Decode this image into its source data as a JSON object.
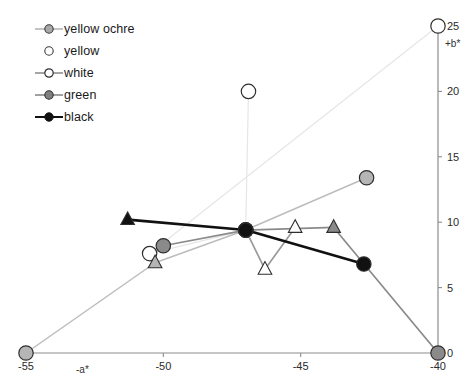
{
  "chart_data": {
    "type": "scatter",
    "title": "",
    "xlabel": "-a*",
    "ylabel": "+b*",
    "xlim": [
      -55,
      -40
    ],
    "ylim": [
      0,
      25
    ],
    "xticks": [
      -55,
      -50,
      -45,
      -40
    ],
    "xticklabels": [
      "-55",
      "-50",
      "-45",
      "-40"
    ],
    "yticks": [
      0,
      5,
      10,
      15,
      20,
      25
    ],
    "yticklabels": [
      "0",
      "5",
      "10",
      "15",
      "20",
      "25"
    ],
    "grid": false,
    "legend_position": "top-left",
    "axes_style": "bottom-x-axis, right-y-axis",
    "series": [
      {
        "name": "yellow ochre",
        "color": "#b5b5b5",
        "marker": "mixed-circle-triangle",
        "line": true,
        "points": [
          {
            "x": -55.0,
            "y": 0.0,
            "marker": "circle"
          },
          {
            "x": -50.3,
            "y": 6.9,
            "marker": "triangle"
          },
          {
            "x": -47.0,
            "y": 9.4,
            "marker": "circle"
          },
          {
            "x": -42.6,
            "y": 13.4,
            "marker": "circle"
          }
        ]
      },
      {
        "name": "yellow",
        "color": "#efefef",
        "marker": "open-circle",
        "line": true,
        "points": [
          {
            "x": -46.9,
            "y": 20.0,
            "marker": "open-circle"
          },
          {
            "x": -47.0,
            "y": 9.4,
            "marker": "circle"
          },
          {
            "x": -50.5,
            "y": 7.6,
            "marker": "open-circle"
          },
          {
            "x": -40.0,
            "y": 25.0,
            "marker": "open-circle"
          }
        ]
      },
      {
        "name": "white",
        "color": "#9a9a9a",
        "marker": "open-triangle",
        "line": true,
        "points": [
          {
            "x": -47.0,
            "y": 9.4,
            "marker": "circle"
          },
          {
            "x": -46.3,
            "y": 6.4,
            "marker": "open-triangle"
          },
          {
            "x": -45.2,
            "y": 9.6,
            "marker": "open-triangle"
          }
        ]
      },
      {
        "name": "green",
        "color": "#8a8a8a",
        "marker": "circle",
        "line": true,
        "points": [
          {
            "x": -50.0,
            "y": 8.2,
            "marker": "circle"
          },
          {
            "x": -47.0,
            "y": 9.4,
            "marker": "circle"
          },
          {
            "x": -43.8,
            "y": 9.6,
            "marker": "triangle"
          },
          {
            "x": -40.0,
            "y": 0.0,
            "marker": "circle"
          }
        ]
      },
      {
        "name": "black",
        "color": "#111111",
        "marker": "circle",
        "line": true,
        "points": [
          {
            "x": -51.3,
            "y": 10.2,
            "marker": "triangle"
          },
          {
            "x": -47.0,
            "y": 9.4,
            "marker": "circle"
          },
          {
            "x": -42.7,
            "y": 6.8,
            "marker": "circle"
          }
        ]
      }
    ]
  },
  "legend": {
    "items": [
      {
        "label": "yellow ochre",
        "key": "line-filled-circle-gray"
      },
      {
        "label": "yellow",
        "key": "open-circle-no-line"
      },
      {
        "label": "white",
        "key": "line-open-circle"
      },
      {
        "label": "green",
        "key": "line-filled-circle-darkgray"
      },
      {
        "label": "black",
        "key": "line-filled-circle-black"
      }
    ]
  },
  "axes": {
    "x_title": "-a*",
    "y_title": "+b*",
    "x_labels": [
      "-55",
      "-50",
      "-45",
      "-40"
    ],
    "y_labels": [
      "25",
      "20",
      "15",
      "10",
      "5",
      "0"
    ]
  },
  "colors": {
    "axis": "#8c8c8c",
    "text": "#1f1f1f",
    "yellow_ochre": "#b5b5b5",
    "yellow": "#efefef",
    "white": "#ffffff",
    "green": "#8a8a8a",
    "black": "#111111"
  }
}
